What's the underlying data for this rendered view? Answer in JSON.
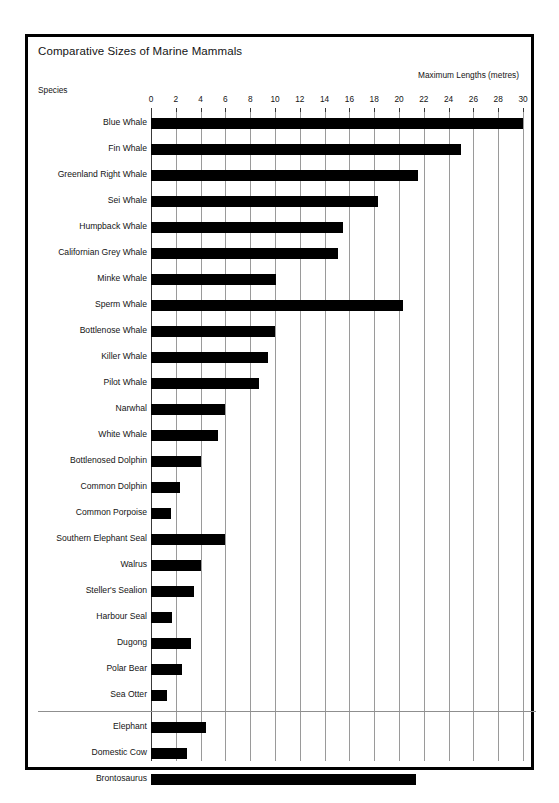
{
  "chart_data": {
    "type": "bar",
    "orientation": "horizontal",
    "title": "Comparative Sizes of Marine Mammals",
    "xlabel": "Maximum Lengths (metres)",
    "ylabel": "Species",
    "xlim": [
      0,
      30
    ],
    "xticks": [
      0,
      2,
      4,
      6,
      8,
      10,
      12,
      14,
      16,
      18,
      20,
      22,
      24,
      26,
      28,
      30
    ],
    "grid": "vertical",
    "legend": "none",
    "units": "metres",
    "categories": [
      "Blue Whale",
      "Fin Whale",
      "Greenland Right Whale",
      "Sei Whale",
      "Humpback Whale",
      "Californian Grey Whale",
      "Minke Whale",
      "Sperm Whale",
      "Bottlenose Whale",
      "Killer Whale",
      "Pilot Whale",
      "Narwhal",
      "White Whale",
      "Bottlenosed Dolphin",
      "Common Dolphin",
      "Common Porpoise",
      "Southern Elephant Seal",
      "Walrus",
      "Steller's Sealion",
      "Harbour Seal",
      "Dugong",
      "Polar Bear",
      "Sea Otter",
      "Elephant",
      "Domestic Cow",
      "Brontosaurus"
    ],
    "values": [
      30.0,
      25.0,
      21.5,
      18.3,
      15.5,
      15.1,
      10.1,
      20.3,
      10.0,
      9.4,
      8.7,
      6.0,
      5.4,
      4.0,
      2.3,
      1.6,
      6.0,
      4.0,
      3.5,
      1.7,
      3.2,
      2.5,
      1.3,
      4.4,
      2.9,
      21.4
    ],
    "groups": [
      {
        "name": "marine-mammals",
        "start": 0,
        "count": 23
      },
      {
        "name": "comparison-animals",
        "start": 23,
        "count": 3
      }
    ],
    "bar_color": "#000000",
    "grid_color": "#9a9a9a",
    "divider_color": "#8f8f8f",
    "frame_color": "#000000",
    "background_color": "#ffffff"
  }
}
